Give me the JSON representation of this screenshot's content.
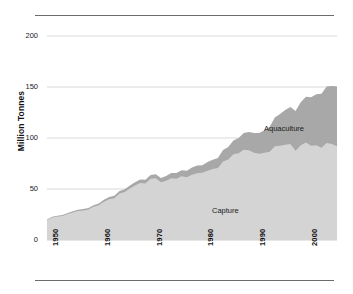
{
  "figure": {
    "name": "world-fisheries-production-area-chart",
    "background": "#ffffff",
    "rule_color": "#6b6b6b"
  },
  "chart_data": {
    "type": "area",
    "stacked": true,
    "title": "",
    "subtitle": "",
    "xlabel": "",
    "ylabel": "Million Tonnes",
    "xlim": [
      1950,
      2006
    ],
    "ylim": [
      0,
      200
    ],
    "grid": "horizontal",
    "legend_position": "inline-annotation",
    "gridline_color": "#c9c9c9",
    "ytick_values": [
      0,
      50,
      100,
      150,
      200
    ],
    "ytick_labels": [
      "0",
      "50",
      "100",
      "150",
      "200"
    ],
    "xtick_values": [
      1950,
      1960,
      1970,
      1980,
      1990,
      2000
    ],
    "xtick_labels": [
      "1950",
      "1960",
      "1970",
      "1980",
      "1990",
      "2000"
    ],
    "x": [
      1950,
      1951,
      1952,
      1953,
      1954,
      1955,
      1956,
      1957,
      1958,
      1959,
      1960,
      1961,
      1962,
      1963,
      1964,
      1965,
      1966,
      1967,
      1968,
      1969,
      1970,
      1971,
      1972,
      1973,
      1974,
      1975,
      1976,
      1977,
      1978,
      1979,
      1980,
      1981,
      1982,
      1983,
      1984,
      1985,
      1986,
      1987,
      1988,
      1989,
      1990,
      1991,
      1992,
      1993,
      1994,
      1995,
      1996,
      1997,
      1998,
      1999,
      2000,
      2001,
      2002,
      2003,
      2004,
      2005,
      2006
    ],
    "series": [
      {
        "name": "Capture",
        "label": "Capture",
        "color": "#d4d4d4",
        "values": [
          19.5,
          22.0,
          23.0,
          23.5,
          25.5,
          27.0,
          28.5,
          29.0,
          30.0,
          32.5,
          34.0,
          37.5,
          40.0,
          41.0,
          45.5,
          47.0,
          50.5,
          53.5,
          56.0,
          55.5,
          60.0,
          60.5,
          56.5,
          58.0,
          60.5,
          60.0,
          62.5,
          61.5,
          64.0,
          65.5,
          66.0,
          68.0,
          69.5,
          70.5,
          77.0,
          79.0,
          84.0,
          85.0,
          88.5,
          88.0,
          85.5,
          84.5,
          85.5,
          86.5,
          92.0,
          92.5,
          93.5,
          94.0,
          87.5,
          93.0,
          95.5,
          92.5,
          93.0,
          90.5,
          95.0,
          94.0,
          92.0
        ]
      },
      {
        "name": "Aquaculture",
        "label": "Aquaculture",
        "color": "#a8a8a8",
        "values": [
          0.6,
          0.7,
          0.8,
          0.9,
          1.0,
          1.1,
          1.2,
          1.3,
          1.4,
          1.6,
          1.7,
          1.9,
          2.1,
          2.3,
          2.5,
          2.7,
          2.9,
          3.1,
          3.3,
          3.5,
          3.7,
          4.0,
          4.4,
          4.8,
          5.2,
          5.6,
          6.0,
          6.5,
          7.0,
          7.5,
          7.4,
          8.4,
          9.2,
          10.0,
          11.3,
          12.2,
          13.5,
          15.0,
          16.5,
          18.0,
          19.3,
          20.5,
          22.0,
          24.5,
          28.0,
          31.0,
          34.0,
          36.5,
          39.0,
          42.0,
          45.0,
          47.5,
          50.0,
          53.0,
          55.5,
          57.0,
          58.5
        ]
      }
    ],
    "annotations": [
      {
        "text": "Capture",
        "series": "Capture"
      },
      {
        "text": "Aquaculture",
        "series": "Aquaculture"
      }
    ]
  }
}
